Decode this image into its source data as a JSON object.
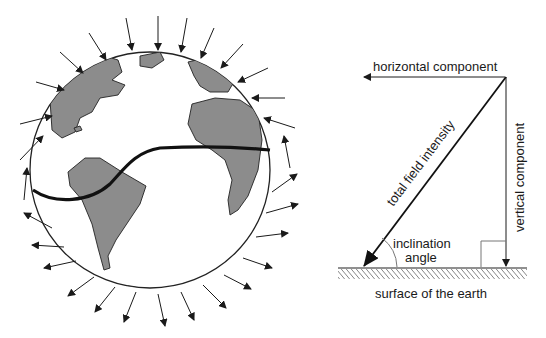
{
  "globe": {
    "description": "Earth with magnetic field lines: arrows point inward in the northern hemisphere and outward in the southern hemisphere; heavy curve marks the magnetic equator",
    "land_color": "#8c8c8c",
    "ocean_color": "#ffffff",
    "outline_color": "#222222"
  },
  "vector_diagram": {
    "horizontal_label": "horizontal component",
    "vertical_label": "vertical component",
    "total_label": "total field intensity",
    "inclination_label_line1": "inclination",
    "inclination_label_line2": "angle",
    "surface_label": "surface of the earth"
  }
}
